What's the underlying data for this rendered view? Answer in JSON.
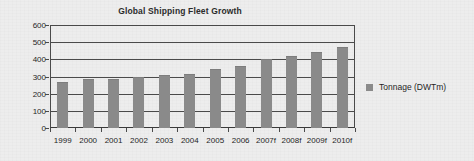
{
  "chart_data": {
    "type": "bar",
    "title": "Global Shipping Fleet Growth",
    "xlabel": "",
    "ylabel": "",
    "ylim": [
      0,
      600
    ],
    "yticks": [
      0,
      100,
      200,
      300,
      400,
      500,
      600
    ],
    "grid": true,
    "legend_position": "right",
    "categories": [
      "1999",
      "2000",
      "2001",
      "2002",
      "2003",
      "2004",
      "2005",
      "2006",
      "2007f",
      "2008f",
      "2009f",
      "2010f"
    ],
    "series": [
      {
        "name": "Tonnage (DWTm)",
        "color": "#8a8a8a",
        "values": [
          270,
          283,
          288,
          300,
          307,
          313,
          342,
          360,
          400,
          422,
          440,
          470
        ]
      }
    ]
  },
  "legend": {
    "label": "Tonnage (DWTm)",
    "swatch_color": "#8a8a8a",
    "swatch_icon": "square-swatch-icon"
  },
  "axis": {
    "y_labels": [
      "600",
      "500",
      "400",
      "300",
      "200",
      "100",
      "0"
    ],
    "x_labels": [
      "1999",
      "2000",
      "2001",
      "2002",
      "2003",
      "2004",
      "2005",
      "2006",
      "2007f",
      "2008f",
      "2009f",
      "2010f"
    ]
  },
  "colors": {
    "background": "#ededed",
    "bar": "#8a8a8a",
    "axis": "#4a4a4a",
    "text": "#1f1f1f",
    "title": "#2b2b2b"
  }
}
